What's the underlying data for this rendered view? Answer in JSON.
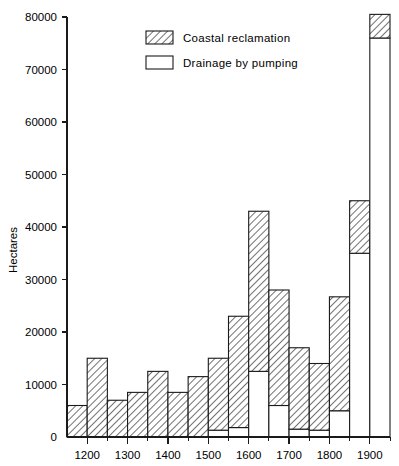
{
  "chart_data": {
    "type": "bar",
    "title": "",
    "subtitle": "",
    "xlabel": "",
    "ylabel": "Hectares",
    "xlim": [
      1150,
      1950
    ],
    "ylim": [
      0,
      80000
    ],
    "grid": false,
    "legend_position": "top-center",
    "bin_width": 50,
    "stacked": true,
    "x_tick_labels": [
      "1200",
      "1300",
      "1400",
      "1500",
      "1600",
      "1700",
      "1800",
      "1900"
    ],
    "x_tick_values": [
      1200,
      1300,
      1400,
      1500,
      1600,
      1700,
      1800,
      1900
    ],
    "x_minor_tick_values": [
      1250,
      1350,
      1450,
      1550,
      1650,
      1750,
      1850,
      1950
    ],
    "y_tick_labels": [
      "0",
      "10000",
      "20000",
      "30000",
      "40000",
      "50000",
      "60000",
      "70000",
      "80000"
    ],
    "y_tick_values": [
      0,
      10000,
      20000,
      30000,
      40000,
      50000,
      60000,
      70000,
      80000
    ],
    "categories": [
      1150,
      1200,
      1250,
      1300,
      1350,
      1400,
      1450,
      1500,
      1550,
      1600,
      1650,
      1700,
      1750,
      1800,
      1850,
      1900
    ],
    "bin_labels": [
      "1150-1200",
      "1200-1250",
      "1250-1300",
      "1300-1350",
      "1350-1400",
      "1400-1450",
      "1450-1500",
      "1500-1550",
      "1550-1600",
      "1600-1650",
      "1650-1700",
      "1700-1750",
      "1750-1800",
      "1800-1850",
      "1850-1900",
      "1900-1950"
    ],
    "series": [
      {
        "name": "Drainage by pumping",
        "fill": "#ffffff",
        "pattern": "solid-white",
        "values": [
          0,
          0,
          0,
          0,
          0,
          0,
          0,
          1300,
          1800,
          12500,
          6000,
          1500,
          1300,
          5000,
          35000,
          76000
        ]
      },
      {
        "name": "Coastal reclamation",
        "fill": "#ffffff",
        "pattern": "diagonal-hatch",
        "values": [
          6000,
          15000,
          7000,
          8500,
          12500,
          8500,
          11500,
          13700,
          21200,
          30500,
          22000,
          15500,
          12700,
          21700,
          10000,
          4500
        ]
      }
    ],
    "totals": [
      6000,
      15000,
      7000,
      8500,
      12500,
      8500,
      11500,
      15000,
      23000,
      43000,
      28000,
      17000,
      14000,
      26700,
      45000,
      80500
    ],
    "annotations": []
  },
  "legend": {
    "items": [
      {
        "label": "Coastal reclamation",
        "swatch": "hatched-rect"
      },
      {
        "label": "Drainage by pumping",
        "swatch": "white-rect"
      }
    ]
  },
  "colors": {
    "axis": "#1a1a1a",
    "hatch": "#555555",
    "background": "#ffffff"
  }
}
